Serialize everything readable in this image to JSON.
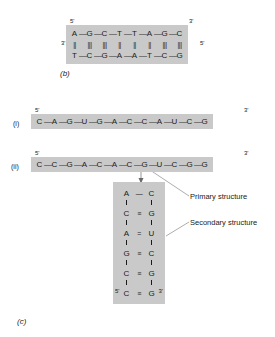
{
  "figure": {
    "panel_b_label": "(b)",
    "panel_c_label": "(c)"
  },
  "dna_duplex": {
    "top_five_prime": "5'",
    "top_three_prime": "3'",
    "bottom_five_prime": "5'",
    "bottom_three_prime": "3'",
    "top_strand": [
      "A",
      "G",
      "C",
      "T",
      "T",
      "A",
      "G",
      "C"
    ],
    "bottom_strand": [
      "T",
      "C",
      "G",
      "A",
      "A",
      "T",
      "C",
      "G"
    ],
    "hydrogen_bonds": [
      2,
      3,
      3,
      2,
      2,
      2,
      3,
      3
    ],
    "backbone_link": "—"
  },
  "rna_i": {
    "roman": "(i)",
    "five_prime": "5'",
    "three_prime": "3'",
    "strand": [
      "C",
      "A",
      "G",
      "U",
      "G",
      "A",
      "C",
      "C",
      "A",
      "U",
      "C",
      "G"
    ],
    "backbone_link": "—"
  },
  "rna_ii": {
    "roman": "(ii)",
    "five_prime": "5'",
    "three_prime": "3'",
    "strand": [
      "C",
      "C",
      "G",
      "A",
      "C",
      "A",
      "C",
      "G",
      "U",
      "C",
      "G",
      "G"
    ],
    "backbone_link": "—"
  },
  "hairpin": {
    "loop": {
      "left": "A",
      "right": "C",
      "link": "—"
    },
    "pairs": [
      {
        "left": "C",
        "bond": "≡",
        "right": "G",
        "bond_count": 3
      },
      {
        "left": "A",
        "bond": "=",
        "right": "U",
        "bond_count": 2
      },
      {
        "left": "G",
        "bond": "≡",
        "right": "C",
        "bond_count": 3
      },
      {
        "left": "C",
        "bond": "≡",
        "right": "G",
        "bond_count": 3
      },
      {
        "left": "C",
        "bond": "≡",
        "right": "G",
        "bond_count": 3
      }
    ],
    "five_prime": "5'",
    "three_prime": "3'"
  },
  "annotations": {
    "primary": "Primary structure",
    "secondary": "Secondary structure"
  },
  "colors": {
    "shade": "#c9c9c9",
    "ink": "#1a1a1a",
    "background": "#ffffff",
    "leader": "#8a8a8a"
  }
}
